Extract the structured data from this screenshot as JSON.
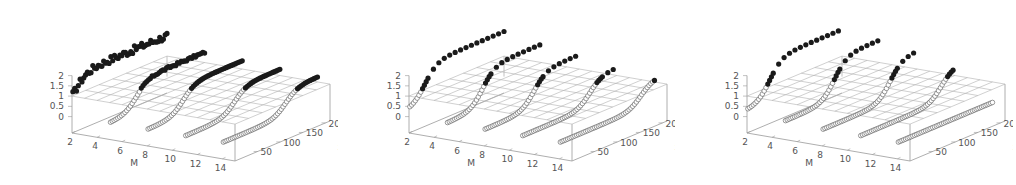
{
  "chart_data": [
    {
      "type": "scatter3d",
      "title": "",
      "xlabel": "M",
      "ylabel": "x",
      "zlabel": "",
      "x_ticks": [
        "2",
        "4",
        "6",
        "8",
        "10",
        "12",
        "14"
      ],
      "y_ticks": [
        "50",
        "100",
        "150",
        "200"
      ],
      "z_ticks": [
        "0",
        "0.5",
        "1",
        "1.5",
        "2"
      ],
      "xlim": [
        2,
        15
      ],
      "ylim": [
        0,
        210
      ],
      "zlim": [
        -0.8,
        2
      ],
      "grid": "plane at z=1",
      "series": [
        {
          "name": "below (open circles)",
          "marker": "open-circle",
          "M": [
            2,
            5,
            8,
            11,
            14
          ]
        },
        {
          "name": "above (filled circles)",
          "marker": "filled-circle",
          "M": [
            2,
            5,
            8,
            11,
            14
          ]
        }
      ],
      "curves": [
        {
          "M": 2,
          "x_transition": 5,
          "z_start": 0.3,
          "z_end": 2.0,
          "noise": "high"
        },
        {
          "M": 5,
          "x_transition": 60,
          "z_start": 0.0,
          "z_end": 1.5,
          "noise": "med"
        },
        {
          "M": 8,
          "x_transition": 80,
          "z_start": 0.0,
          "z_end": 1.4,
          "noise": "low"
        },
        {
          "M": 11,
          "x_transition": 110,
          "z_start": 0.0,
          "z_end": 1.3,
          "noise": "low"
        },
        {
          "M": 14,
          "x_transition": 140,
          "z_start": 0.0,
          "z_end": 1.25,
          "noise": "low"
        }
      ]
    },
    {
      "type": "scatter3d",
      "title": "",
      "xlabel": "M",
      "ylabel": "x",
      "zlabel": "",
      "x_ticks": [
        "2",
        "4",
        "6",
        "8",
        "10",
        "12",
        "14"
      ],
      "y_ticks": [
        "50",
        "100",
        "150",
        "200"
      ],
      "z_ticks": [
        "0",
        "0.5",
        "1",
        "1.5",
        "2"
      ],
      "xlim": [
        2,
        15
      ],
      "ylim": [
        0,
        210
      ],
      "zlim": [
        -0.8,
        2
      ],
      "grid": "plane at z=1",
      "series": [
        {
          "name": "below (open circles)",
          "marker": "open-circle",
          "M": [
            2,
            5,
            8,
            11,
            14
          ]
        },
        {
          "name": "above (filled circles)",
          "marker": "filled-circle",
          "M": [
            2,
            5,
            8,
            11,
            14
          ]
        }
      ],
      "curves": [
        {
          "M": 2,
          "x_transition": 35,
          "z_start": 0.3,
          "z_end": 2.2,
          "sparse_above": true
        },
        {
          "M": 5,
          "x_transition": 80,
          "z_start": 0.0,
          "z_end": 1.9,
          "sparse_above": true
        },
        {
          "M": 8,
          "x_transition": 110,
          "z_start": 0.0,
          "z_end": 1.7,
          "sparse_above": true
        },
        {
          "M": 11,
          "x_transition": 150,
          "z_start": 0.0,
          "z_end": 1.4,
          "sparse_above": true
        },
        {
          "M": 14,
          "x_transition": 180,
          "z_start": 0.0,
          "z_end": 1.2,
          "sparse_above": true
        }
      ]
    },
    {
      "type": "scatter3d",
      "title": "",
      "xlabel": "M",
      "ylabel": "x",
      "zlabel": "",
      "x_ticks": [
        "2",
        "4",
        "6",
        "8",
        "10",
        "12",
        "14"
      ],
      "y_ticks": [
        "50",
        "100",
        "150",
        "200"
      ],
      "z_ticks": [
        "0",
        "0.5",
        "1",
        "1.5",
        "2"
      ],
      "xlim": [
        2,
        15
      ],
      "ylim": [
        0,
        210
      ],
      "zlim": [
        -0.8,
        2
      ],
      "grid": "plane at z=1",
      "series": [
        {
          "name": "below (open circles)",
          "marker": "open-circle",
          "M": [
            2,
            5,
            8,
            11,
            14
          ]
        },
        {
          "name": "above (filled circles)",
          "marker": "filled-circle",
          "M": [
            2,
            5,
            8,
            11,
            14
          ]
        }
      ],
      "curves": [
        {
          "M": 2,
          "x_transition": 50,
          "z_start": 0.3,
          "z_end": 2.3,
          "sparse_above": true
        },
        {
          "M": 5,
          "x_transition": 110,
          "z_start": 0.1,
          "z_end": 2.1,
          "sparse_above": true
        },
        {
          "M": 8,
          "x_transition": 150,
          "z_start": 0.0,
          "z_end": 1.9,
          "sparse_above": true
        },
        {
          "M": 11,
          "x_transition": 180,
          "z_start": 0.0,
          "z_end": 1.5,
          "sparse_above": true
        },
        {
          "M": 14,
          "x_transition": 999,
          "z_start": 0.0,
          "z_end": 1.0,
          "sparse_above": true
        }
      ]
    }
  ],
  "panels": [
    {
      "offset_x": 0
    },
    {
      "offset_x": 337
    },
    {
      "offset_x": 675
    }
  ],
  "colors": {
    "axis": "#999999",
    "grid": "#b0b0b0",
    "filled": "#1a1a1a",
    "open": "#555555",
    "text": "#555555"
  }
}
